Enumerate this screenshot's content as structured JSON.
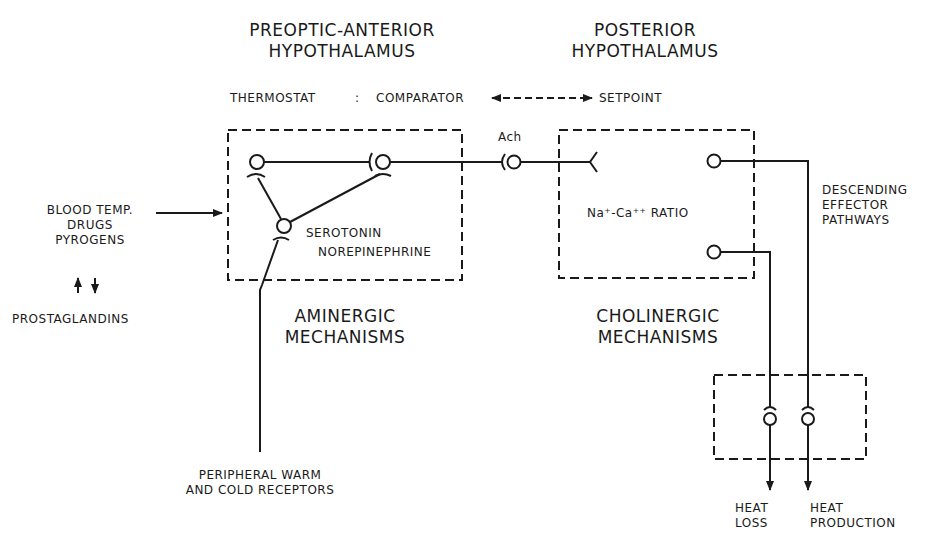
{
  "titles": {
    "preoptic_line1": "PREOPTIC-ANTERIOR",
    "preoptic_line2": "HYPOTHALAMUS",
    "posterior_line1": "POSTERIOR",
    "posterior_line2": "HYPOTHALAMUS"
  },
  "thermostat": {
    "label": "THERMOSTAT",
    "colon": ":",
    "comparator": "COMPARATOR",
    "setpoint": "SETPOINT"
  },
  "inputs": {
    "line1": "BLOOD TEMP.",
    "line2": "DRUGS",
    "line3": "PYROGENS",
    "arrows": "↑↓",
    "prostaglandins": "PROSTAGLANDINS"
  },
  "aminergic_box": {
    "transmitter1": "SEROTONIN",
    "transmitter2": "NOREPINEPHRINE",
    "caption_line1": "AMINERGIC",
    "caption_line2": "MECHANISMS"
  },
  "synapse_label": "Ach",
  "cholinergic_box": {
    "ratio": "Na⁺-Ca⁺⁺ RATIO",
    "caption_line1": "CHOLINERGIC",
    "caption_line2": "MECHANISMS"
  },
  "effector": {
    "line1": "DESCENDING",
    "line2": "EFFECTOR",
    "line3": "PATHWAYS"
  },
  "outputs": {
    "heat_loss_line1": "HEAT",
    "heat_loss_line2": "LOSS",
    "heat_prod_line1": "HEAT",
    "heat_prod_line2": "PRODUCTION"
  },
  "receptors": {
    "line1": "PERIPHERAL WARM",
    "line2": "AND COLD RECEPTORS"
  }
}
